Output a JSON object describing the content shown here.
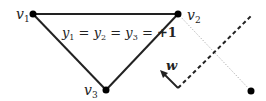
{
  "diagram": {
    "vertices": [
      {
        "id": "v1",
        "label": "v",
        "subscript": "1",
        "x": 33,
        "y": 14
      },
      {
        "id": "v2",
        "label": "v",
        "subscript": "2",
        "x": 178,
        "y": 14
      },
      {
        "id": "v3",
        "label": "v",
        "subscript": "3",
        "x": 106,
        "y": 90
      }
    ],
    "outside_point": {
      "x": 251,
      "y": 91
    },
    "equation": {
      "y1": "y",
      "s1": "1",
      "y2": "y",
      "s2": "2",
      "y3": "y",
      "s3": "3",
      "eq": "=",
      "value": "+1"
    },
    "normal_vector": {
      "label": "w"
    },
    "colors": {
      "edge": "#222222",
      "dashed": "#222222",
      "dotted": "#999999",
      "point": "#000000"
    }
  }
}
